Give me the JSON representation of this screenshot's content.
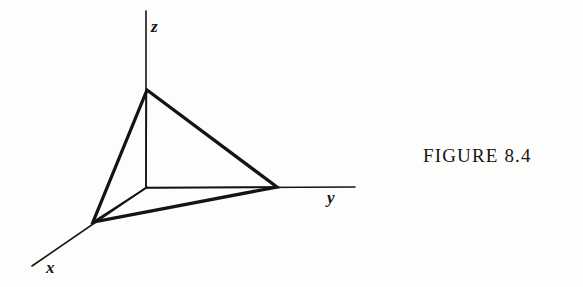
{
  "figure": {
    "caption": "FIGURE 8.4",
    "background_color": "#fdfdfb",
    "ink_color": "#141414"
  },
  "axes": {
    "z": {
      "label": "z",
      "from": [
        146,
        11
      ],
      "to": [
        146,
        188
      ]
    },
    "y": {
      "label": "y",
      "from": [
        146,
        188
      ],
      "to": [
        355,
        187
      ]
    },
    "x": {
      "label": "x",
      "from": [
        146,
        188
      ],
      "to": [
        32,
        266
      ]
    }
  },
  "origin": [
    146,
    188
  ],
  "plane_triangle": {
    "name": "intercept-plane",
    "vertices": [
      {
        "name": "z-intercept",
        "point": [
          147,
          90
        ]
      },
      {
        "name": "y-intercept",
        "point": [
          277,
          187
        ]
      },
      {
        "name": "x-intercept",
        "point": [
          93,
          222
        ]
      }
    ],
    "path": "M 147 90 L 277 187 L 93 222 Z"
  },
  "inner_edges": [
    {
      "name": "origin-to-z-intercept",
      "path": "M 146.5 90 L 146 188"
    },
    {
      "name": "origin-to-y-intercept",
      "path": "M 146 187.5 L 277 187"
    },
    {
      "name": "origin-to-x-intercept",
      "path": "M 146 188 L 93 222"
    }
  ]
}
